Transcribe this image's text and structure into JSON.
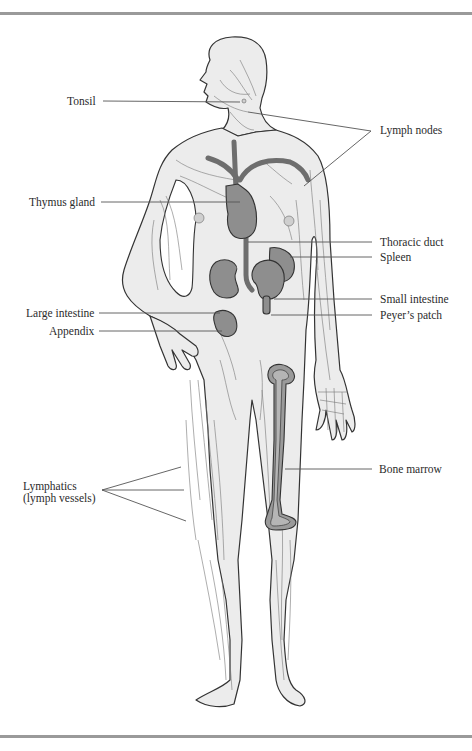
{
  "figure": {
    "colors": {
      "rule": "#9a9a9a",
      "body_fill": "#ececec",
      "organ_fill": "#8e8e8e",
      "outline": "#333333",
      "text": "#2b2b2b"
    },
    "labels": [
      {
        "id": "tonsil",
        "text": "Tonsil",
        "side": "left"
      },
      {
        "id": "lymph-nodes",
        "text": "Lymph nodes",
        "side": "right"
      },
      {
        "id": "thymus-gland",
        "text": "Thymus gland",
        "side": "left"
      },
      {
        "id": "thoracic-duct",
        "text": "Thoracic duct",
        "side": "right"
      },
      {
        "id": "spleen",
        "text": "Spleen",
        "side": "right"
      },
      {
        "id": "large-intestine",
        "text": "Large intestine",
        "side": "left"
      },
      {
        "id": "small-intestine",
        "text": "Small intestine",
        "side": "right"
      },
      {
        "id": "appendix",
        "text": "Appendix",
        "side": "left"
      },
      {
        "id": "peyers-patch",
        "text": "Peyer’s patch",
        "side": "right"
      },
      {
        "id": "bone-marrow",
        "text": "Bone marrow",
        "side": "right"
      },
      {
        "id": "lymphatics",
        "text": "Lymphatics",
        "text2": "(lymph vessels)",
        "side": "left"
      }
    ]
  }
}
